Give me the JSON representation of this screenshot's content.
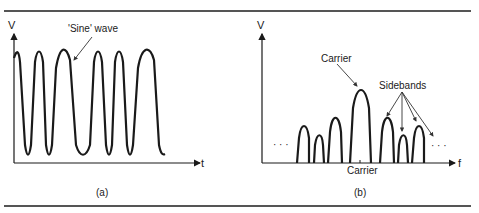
{
  "figure": {
    "panel_a": {
      "caption": "(a)",
      "y_axis_label": "V",
      "x_axis_label": "t",
      "annotation": "'Sine' wave",
      "description": "Frequency-modulated carrier waveform in time domain"
    },
    "panel_b": {
      "caption": "(b)",
      "y_axis_label": "V",
      "x_axis_label": "f",
      "carrier_annotation": "Carrier",
      "sidebands_annotation": "Sidebands",
      "carrier_tick_label": "Carrier",
      "ellipsis_left": "· · ·",
      "ellipsis_right": "· · ·",
      "description": "Frequency spectrum showing carrier and sidebands",
      "lobes": [
        {
          "name": "lower-sideband-3",
          "relative_height": 0.45
        },
        {
          "name": "lower-sideband-2",
          "relative_height": 0.3
        },
        {
          "name": "lower-sideband-1",
          "relative_height": 0.6
        },
        {
          "name": "carrier",
          "relative_height": 1.0
        },
        {
          "name": "upper-sideband-1",
          "relative_height": 0.6
        },
        {
          "name": "upper-sideband-2",
          "relative_height": 0.3
        },
        {
          "name": "upper-sideband-3",
          "relative_height": 0.45
        }
      ]
    }
  }
}
